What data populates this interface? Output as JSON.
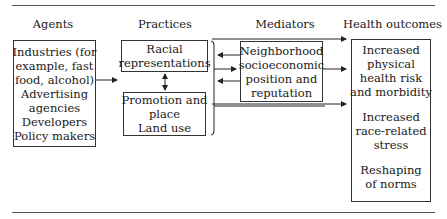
{
  "diagram": {
    "columns": {
      "agents": {
        "header": "Agents"
      },
      "practices": {
        "header": "Practices"
      },
      "mediators": {
        "header": "Mediators"
      },
      "outcomes": {
        "header": "Health outcomes"
      }
    },
    "agents_box": {
      "lines": [
        "Industries (for",
        "example, fast",
        "food, alcohol)",
        "Advertising",
        "agencies",
        "Developers",
        "Policy makers"
      ]
    },
    "practices_boxes": [
      {
        "lines": [
          "Racial",
          "representations"
        ]
      },
      {
        "lines": [
          "Promotion and",
          "place",
          "Land use"
        ]
      }
    ],
    "mediators_box": {
      "lines": [
        "Neighborhood",
        "socioeconomic",
        "position and",
        "reputation"
      ]
    },
    "outcomes_box": {
      "groups": [
        [
          "Increased",
          "physical",
          "health risk",
          "and morbidity"
        ],
        [
          "Increased",
          "race-related",
          "stress"
        ],
        [
          "Reshaping",
          "of norms"
        ]
      ]
    },
    "connections": [
      {
        "from": "agents",
        "to": "practices",
        "type": "arrow"
      },
      {
        "from": "racial-representations",
        "to": "promotion-and-place",
        "type": "bidirectional"
      },
      {
        "from": "practices",
        "to": "health-outcomes",
        "type": "arrow",
        "note": "top bypass"
      },
      {
        "from": "mediators",
        "to": "practices",
        "type": "arrow"
      },
      {
        "from": "practices",
        "to": "mediators",
        "type": "arrow"
      },
      {
        "from": "mediators",
        "to": "practices",
        "type": "arrow"
      },
      {
        "from": "mediators",
        "to": "health-outcomes",
        "type": "arrow"
      },
      {
        "from": "practices",
        "to": "health-outcomes",
        "type": "arrow",
        "note": "bottom bypass"
      }
    ],
    "colors": {
      "line": "#333333",
      "text": "#1a1a1a",
      "background": "#ffffff"
    }
  }
}
